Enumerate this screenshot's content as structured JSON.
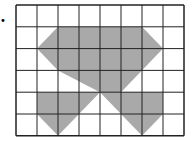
{
  "diagram": {
    "grid": {
      "cols": 8,
      "rows": 6,
      "x0": 16,
      "y0": 5,
      "cell_w": 21,
      "cell_h": 21.8
    },
    "fill_color": "#a9a9a9",
    "line_color": "#222222",
    "bullet": "•",
    "shapes": [
      {
        "name": "top-hexagon",
        "points": [
          [
            2,
            1
          ],
          [
            6,
            1
          ],
          [
            7,
            2
          ],
          [
            5,
            4
          ],
          [
            4,
            4
          ],
          [
            2,
            3
          ],
          [
            1,
            2
          ]
        ]
      },
      {
        "name": "bottom-left",
        "points": [
          [
            1,
            4
          ],
          [
            3,
            4
          ],
          [
            4,
            4
          ],
          [
            2,
            6
          ],
          [
            1,
            5
          ]
        ]
      },
      {
        "name": "bottom-right",
        "points": [
          [
            4,
            4
          ],
          [
            5,
            4
          ],
          [
            7,
            4
          ],
          [
            7,
            5
          ],
          [
            6,
            6
          ]
        ]
      }
    ]
  }
}
